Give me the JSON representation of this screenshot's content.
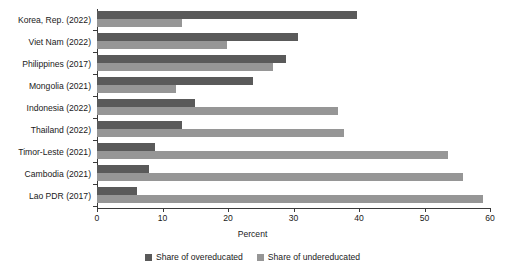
{
  "chart_data": {
    "type": "bar",
    "orientation": "horizontal",
    "title": "",
    "subtitle": "",
    "xlabel": "Percent",
    "ylabel": "",
    "xlim": [
      0,
      60
    ],
    "xticks": [
      0,
      10,
      20,
      30,
      40,
      50,
      60
    ],
    "xtick_labels": [
      "0",
      "10",
      "20",
      "30",
      "40",
      "50",
      "60"
    ],
    "grid": false,
    "legend_position": "bottom-center",
    "categories": [
      "Korea, Rep. (2022)",
      "Viet Nam (2022)",
      "Philippines (2017)",
      "Mongolia (2021)",
      "Indonesia (2022)",
      "Thailand (2022)",
      "Timor-Leste (2021)",
      "Cambodia (2021)",
      "Lao PDR (2017)"
    ],
    "series": [
      {
        "name": "Share of overeducated",
        "color": "#5a5a5a",
        "values": [
          39.7,
          30.7,
          28.9,
          23.8,
          15.0,
          13.0,
          8.9,
          7.9,
          6.1
        ]
      },
      {
        "name": "Share of undereducated",
        "color": "#969696",
        "values": [
          13.0,
          19.8,
          26.9,
          12.1,
          36.8,
          37.7,
          53.6,
          55.9,
          58.9
        ]
      }
    ]
  },
  "axis": {
    "xlabel": "Percent"
  },
  "legend": {
    "items": [
      {
        "label": "Share of overeducated",
        "color": "#5a5a5a"
      },
      {
        "label": "Share of undereducated",
        "color": "#969696"
      }
    ]
  }
}
